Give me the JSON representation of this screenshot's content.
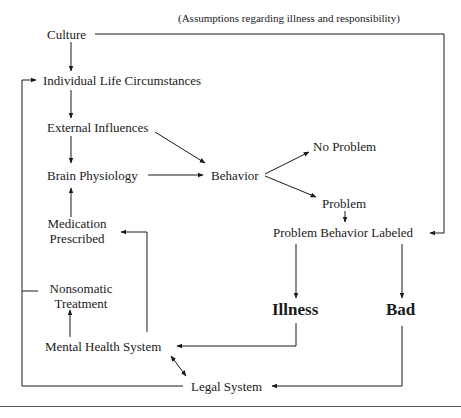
{
  "diagram": {
    "nodes": {
      "culture": "Culture",
      "assumptions_note": "(Assumptions regarding illness and responsibility)",
      "individual_life": "Individual Life Circumstances",
      "external_influences": "External Influences",
      "brain_physiology": "Brain Physiology",
      "behavior": "Behavior",
      "no_problem": "No Problem",
      "problem": "Problem",
      "problem_behavior_labeled": "Problem Behavior Labeled",
      "medication_line1": "Medication",
      "medication_line2": "Prescribed",
      "nonsomatic_line1": "Nonsomatic",
      "nonsomatic_line2": "Treatment",
      "illness": "Illness",
      "bad": "Bad",
      "mental_health_system": "Mental Health System",
      "legal_system": "Legal System"
    },
    "edges": [
      {
        "from": "Culture",
        "to": "Individual Life Circumstances"
      },
      {
        "from": "Culture",
        "to": "Problem Behavior Labeled",
        "label": "(Assumptions regarding illness and responsibility)"
      },
      {
        "from": "Individual Life Circumstances",
        "to": "External Influences"
      },
      {
        "from": "External Influences",
        "to": "Brain Physiology"
      },
      {
        "from": "External Influences",
        "to": "Behavior"
      },
      {
        "from": "Brain Physiology",
        "to": "Behavior"
      },
      {
        "from": "Behavior",
        "to": "No Problem"
      },
      {
        "from": "Behavior",
        "to": "Problem"
      },
      {
        "from": "Problem",
        "to": "Problem Behavior Labeled"
      },
      {
        "from": "Problem Behavior Labeled",
        "to": "Illness"
      },
      {
        "from": "Problem Behavior Labeled",
        "to": "Bad"
      },
      {
        "from": "Illness",
        "to": "Mental Health System"
      },
      {
        "from": "Bad",
        "to": "Legal System"
      },
      {
        "from": "Mental Health System",
        "to": "Legal System",
        "bidirectional": true
      },
      {
        "from": "Mental Health System",
        "to": "Nonsomatic Treatment"
      },
      {
        "from": "Mental Health System",
        "to": "Medication Prescribed"
      },
      {
        "from": "Medication Prescribed",
        "to": "Brain Physiology"
      },
      {
        "from": "Legal System",
        "to": "Individual Life Circumstances"
      },
      {
        "from": "Nonsomatic Treatment",
        "to": "Individual Life Circumstances"
      }
    ],
    "colors": {
      "line": "#1a1a1a",
      "background": "#ffffff"
    }
  }
}
